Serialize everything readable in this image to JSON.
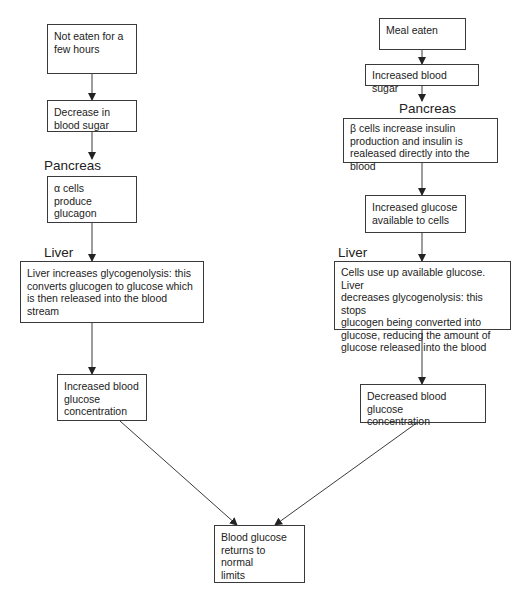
{
  "diagram": {
    "left_branch": {
      "steps": [
        "Not eaten for a\nfew hours",
        "Decrease in\nblood sugar",
        "α cells\nproduce\nglucagon",
        "Liver increases glycogenolysis:   this\nconverts glucogen to glucose which\nis then released into the blood stream",
        "Increased blood\nglucose\nconcentration"
      ],
      "organ_labels": [
        "Pancreas",
        "Liver"
      ]
    },
    "right_branch": {
      "steps": [
        "Meal eaten",
        "Increased blood sugar",
        "β cells increase insulin\nproduction and insulin is\nrealeased directly into the blood",
        "Increased glucose\navailable to cells",
        "Cells use up available glucose.  Liver\ndecreases glycogenolysis: this stops\nglucogen being converted into\nglucose, reducing the amount of\nglucose released into the blood",
        "Decreased blood glucose\nconcentration"
      ],
      "organ_labels": [
        "Pancreas",
        "Liver"
      ]
    },
    "outcome": "Blood glucose\nreturns to normal\nlimits",
    "colors": {
      "line": "#3a3a3a",
      "box_border": "#3a3a3a",
      "text": "#222222",
      "background": "#ffffff"
    }
  }
}
